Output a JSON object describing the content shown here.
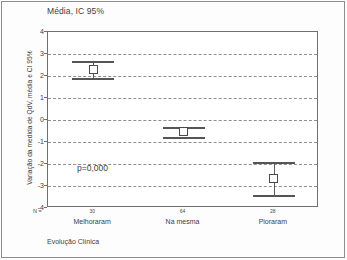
{
  "figure": {
    "title": "Média, IC 95%",
    "y_axis_title": "Variação da medida de QdV, média e CI 95%",
    "x_axis_title": "Evolução Clínica",
    "pvalue_label": "p=0,000",
    "n_prefix": "N ="
  },
  "chart_data": {
    "type": "scatter",
    "title": "Média, IC 95%",
    "xlabel": "Evolução Clínica",
    "ylabel": "Variação da medida de QdV, média e CI 95%",
    "categories": [
      "Melhoraram",
      "Na mesma",
      "Pioraram"
    ],
    "counts": [
      "30",
      "64",
      "28"
    ],
    "means": [
      2.3,
      -0.5,
      -2.65
    ],
    "ci_upper": [
      2.7,
      -0.3,
      -1.9
    ],
    "ci_lower": [
      1.9,
      -0.75,
      -3.4
    ],
    "ylim": [
      -4,
      4
    ],
    "yticks": [
      4,
      3,
      2,
      1,
      0,
      -1,
      -2,
      -3,
      -4
    ],
    "ytick_labels": [
      "4",
      "3",
      "2",
      "1",
      "0",
      "-1",
      "-2",
      "-3",
      "-4"
    ],
    "grid": true,
    "gridlines_at": [
      3,
      2,
      1,
      0,
      -1,
      -2,
      -3
    ],
    "legend": "none",
    "annotations": [
      {
        "text": "p=0,000",
        "x_value": 0.55,
        "y_value": -2.3
      }
    ],
    "marker": "open-square",
    "errorbar_style": "capped",
    "colors": {
      "marker_edge": "#4a4a4a",
      "marker_fill": "#ffffff",
      "errorbar": "#555555",
      "grid": "#8f8f8f",
      "frame": "#6f6f6f",
      "text": "#3d3d3d",
      "background": "#ffffff"
    }
  }
}
